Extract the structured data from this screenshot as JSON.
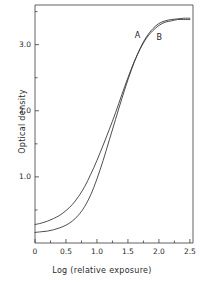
{
  "figure": {
    "background_color": "#ffffff",
    "line_color": "#3a3a3a",
    "text_color": "#2a2a2a"
  },
  "chart_data": {
    "type": "line",
    "title": "",
    "subtitle": "",
    "xlabel": "Log (relative exposure)",
    "ylabel": "Optical density",
    "xlim": [
      0,
      2.55
    ],
    "ylim": [
      0,
      3.6
    ],
    "grid": false,
    "legend_position": "inline-annotations",
    "xticks": [
      {
        "value": 0,
        "label": "0"
      },
      {
        "value": 0.5,
        "label": "0.5"
      },
      {
        "value": 1.0,
        "label": "1.0"
      },
      {
        "value": 1.5,
        "label": "1.5"
      },
      {
        "value": 2.0,
        "label": "2.0"
      },
      {
        "value": 2.5,
        "label": "2.5"
      }
    ],
    "xminor_ticks": [
      0.25,
      0.75,
      1.25,
      1.75,
      2.25
    ],
    "yticks": [
      {
        "value": 1.0,
        "label": "1.0"
      },
      {
        "value": 2.0,
        "label": "2.0"
      },
      {
        "value": 3.0,
        "label": "3.0"
      }
    ],
    "yminor_ticks": [
      0.5,
      1.5,
      2.5,
      3.5
    ],
    "annotations": [
      {
        "text": "A",
        "x": 1.66,
        "y": 3.13
      },
      {
        "text": "B",
        "x": 2.01,
        "y": 3.1
      }
    ],
    "series": [
      {
        "name": "A",
        "label": "A",
        "x": [
          0.0,
          0.1,
          0.2,
          0.3,
          0.4,
          0.5,
          0.6,
          0.7,
          0.8,
          0.9,
          1.0,
          1.1,
          1.2,
          1.3,
          1.4,
          1.5,
          1.6,
          1.7,
          1.8,
          1.9,
          2.0,
          2.1,
          2.2,
          2.3,
          2.4,
          2.5
        ],
        "y": [
          0.28,
          0.3,
          0.33,
          0.37,
          0.42,
          0.49,
          0.58,
          0.7,
          0.85,
          1.04,
          1.25,
          1.48,
          1.72,
          1.97,
          2.24,
          2.5,
          2.74,
          2.94,
          3.1,
          3.21,
          3.29,
          3.34,
          3.36,
          3.38,
          3.38,
          3.38
        ]
      },
      {
        "name": "B",
        "label": "B",
        "x": [
          0.0,
          0.1,
          0.2,
          0.3,
          0.4,
          0.5,
          0.6,
          0.7,
          0.8,
          0.9,
          1.0,
          1.1,
          1.2,
          1.3,
          1.4,
          1.5,
          1.6,
          1.7,
          1.8,
          1.9,
          2.0,
          2.1,
          2.2,
          2.3,
          2.4,
          2.5
        ],
        "y": [
          0.16,
          0.17,
          0.18,
          0.2,
          0.23,
          0.27,
          0.33,
          0.42,
          0.55,
          0.73,
          0.97,
          1.25,
          1.56,
          1.87,
          2.18,
          2.47,
          2.73,
          2.95,
          3.12,
          3.24,
          3.32,
          3.36,
          3.38,
          3.39,
          3.4,
          3.4
        ]
      }
    ]
  },
  "plot_box": {
    "left": 35,
    "right": 193,
    "top": 5,
    "bottom": 243
  }
}
